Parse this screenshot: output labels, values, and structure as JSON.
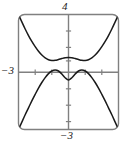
{
  "figure": {
    "name": "calculator-viewport",
    "background_color": "#ffffff",
    "frame_color": "#7a7a7a",
    "curve_color": "#1a1a1a",
    "axis_color": "#7a7a7a",
    "label_color": "#1a1a1a"
  },
  "labels": {
    "y_max": "4",
    "x_min": "−3",
    "y_min": "−3"
  },
  "chart_data": {
    "type": "line",
    "title": "",
    "xlabel": "",
    "ylabel": "",
    "xlim": [
      -3,
      3
    ],
    "ylim": [
      -3,
      4
    ],
    "grid": false,
    "legend": "none",
    "axes": {
      "x_axis_visible": true,
      "y_axis_visible": true,
      "x_ticks": [
        -2,
        -1,
        1,
        2
      ],
      "y_ticks": [
        -2,
        -1,
        1,
        2,
        3
      ],
      "tick_labels_shown": [
        "4",
        "-3",
        "-3"
      ],
      "tick_label_positions": {
        "4": "top of y-axis (y = 4)",
        "-3 left": "left end of x-axis (x = -3)",
        "-3 bottom": "bottom of y-axis (y = -3)"
      }
    },
    "annotations": [
      "viewport frame drawn with rounded corners",
      "two curves plotted: upper W-shaped curve and lower M-shaped curve"
    ],
    "series": [
      {
        "name": "upper-curve",
        "description": "W-shaped curve: decreasing from upper-left corner to a minimum near x=-1.1, rising to a small local maximum at x=0, falling to a minimum near x=1.1, then rising steeply to the upper-right corner",
        "x": [
          -3.0,
          -2.8,
          -2.6,
          -2.4,
          -2.2,
          -2.0,
          -1.8,
          -1.6,
          -1.4,
          -1.2,
          -1.0,
          -0.8,
          -0.6,
          -0.4,
          -0.2,
          0.0,
          0.2,
          0.4,
          0.6,
          0.8,
          1.0,
          1.2,
          1.4,
          1.6,
          1.8,
          2.0,
          2.2,
          2.4,
          2.6,
          2.8,
          3.0
        ],
        "y": [
          4.0,
          3.55,
          3.12,
          2.72,
          2.36,
          2.04,
          1.76,
          1.53,
          1.36,
          1.25,
          1.2,
          1.21,
          1.26,
          1.32,
          1.37,
          1.39,
          1.37,
          1.32,
          1.26,
          1.21,
          1.2,
          1.25,
          1.36,
          1.53,
          1.76,
          2.04,
          2.36,
          2.72,
          3.12,
          3.55,
          4.0
        ]
      },
      {
        "name": "lower-curve",
        "description": "M-shaped curve: rising steeply from the lower-left corner to a maximum near x=-0.8, dipping to a local minimum at x=0, rising to a maximum near x=0.8, then falling steeply to the lower-right corner",
        "x": [
          -3.0,
          -2.8,
          -2.6,
          -2.4,
          -2.2,
          -2.0,
          -1.8,
          -1.6,
          -1.4,
          -1.2,
          -1.0,
          -0.8,
          -0.6,
          -0.4,
          -0.2,
          0.0,
          0.2,
          0.4,
          0.6,
          0.8,
          1.0,
          1.2,
          1.4,
          1.6,
          1.8,
          2.0,
          2.2,
          2.4,
          2.6,
          2.8,
          3.0
        ],
        "y": [
          -3.0,
          -2.55,
          -2.1,
          -1.68,
          -1.26,
          -0.86,
          -0.48,
          -0.14,
          0.16,
          0.4,
          0.56,
          0.62,
          0.56,
          0.38,
          0.15,
          0.02,
          0.15,
          0.38,
          0.56,
          0.62,
          0.56,
          0.4,
          0.16,
          -0.14,
          -0.48,
          -0.86,
          -1.26,
          -1.68,
          -2.1,
          -2.55,
          -3.0
        ]
      }
    ]
  }
}
